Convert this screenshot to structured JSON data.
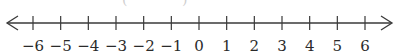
{
  "number_line": {
    "min": -6,
    "max": 6,
    "step": 1,
    "arrows": [
      "left",
      "right"
    ],
    "tick_labels": [
      "−6",
      "−5",
      "−4",
      "−3",
      "−2",
      "−1",
      "0",
      "1",
      "2",
      "3",
      "4",
      "5",
      "6"
    ],
    "colors": {
      "line": "#3a3a3a",
      "text": "#2a2a2a",
      "background": "#ffffff"
    }
  },
  "top_artifact": "( , )"
}
